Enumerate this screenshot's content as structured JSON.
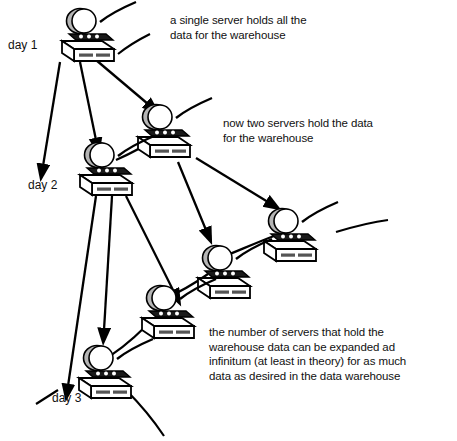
{
  "diagram": {
    "background_color": "#ffffff",
    "ink_color": "#000000",
    "shade_color": "#b0b0b0"
  },
  "day_labels": [
    {
      "id": "day-1",
      "text": "day 1"
    },
    {
      "id": "day-2",
      "text": "day 2"
    },
    {
      "id": "day-3",
      "text": "day 3"
    }
  ],
  "notes": [
    {
      "id": "note-1",
      "text": "a single server holds all the\ndata for the warehouse"
    },
    {
      "id": "note-2",
      "text": "now two servers hold the data\nfor the warehouse"
    },
    {
      "id": "note-3",
      "text": "the number of servers that hold the\nwarehouse data can be expanded ad\ninfinitum (at least in theory) for as much\ndata as desired in the data warehouse"
    }
  ],
  "servers": [
    {
      "name": "server-day1",
      "x": 60,
      "y": 8
    },
    {
      "name": "server-day2-b",
      "x": 136,
      "y": 104
    },
    {
      "name": "server-day2-a",
      "x": 78,
      "y": 142
    },
    {
      "name": "server-day3-d",
      "x": 262,
      "y": 208
    },
    {
      "name": "server-day3-c",
      "x": 196,
      "y": 245
    },
    {
      "name": "server-day3-b",
      "x": 140,
      "y": 285
    },
    {
      "name": "server-day3-a",
      "x": 77,
      "y": 345
    }
  ],
  "icon_names": {
    "server": "server-icon",
    "arrow": "arrow-icon",
    "link": "network-link-line"
  }
}
